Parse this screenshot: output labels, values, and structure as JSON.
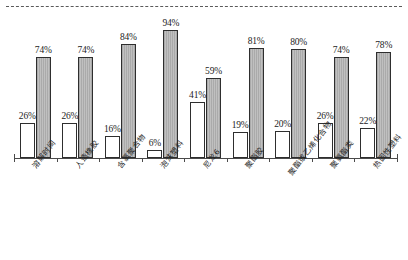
{
  "chart_data": {
    "type": "bar",
    "title": "",
    "subtitle": "",
    "xlabel": "",
    "ylabel": "",
    "ylim": [
      0,
      100
    ],
    "grid": false,
    "legend": "none",
    "units": "%",
    "orientation": "vertical",
    "categories": [
      "溶解时间",
      "人造橡胶",
      "含氯聚合物",
      "泡沫塑料",
      "尼龙6",
      "聚酯胶",
      "聚酯或乙烯化合物",
      "聚氨酯类",
      "热固性塑料"
    ],
    "series": [
      {
        "name": "白色柱",
        "style": "white",
        "values": [
          26,
          26,
          16,
          6,
          41,
          19,
          20,
          26,
          22
        ],
        "labels": [
          "26%",
          "26%",
          "16%",
          "6%",
          "41%",
          "19%",
          "20%",
          "26%",
          "22%"
        ]
      },
      {
        "name": "灰色柱",
        "style": "gray",
        "values": [
          74,
          74,
          84,
          94,
          59,
          81,
          80,
          74,
          78
        ],
        "labels": [
          "74%",
          "74%",
          "84%",
          "94%",
          "59%",
          "81%",
          "80%",
          "74%",
          "78%"
        ]
      }
    ],
    "colors": {
      "white_bar_fill": "#ffffff",
      "gray_bar_fill": "#b4b4b4",
      "bar_outline": "#2e2e2e",
      "axis": "#4a4a4a",
      "top_rule": "#5a5a5a",
      "text": "#232323",
      "background": "#ffffff"
    }
  }
}
